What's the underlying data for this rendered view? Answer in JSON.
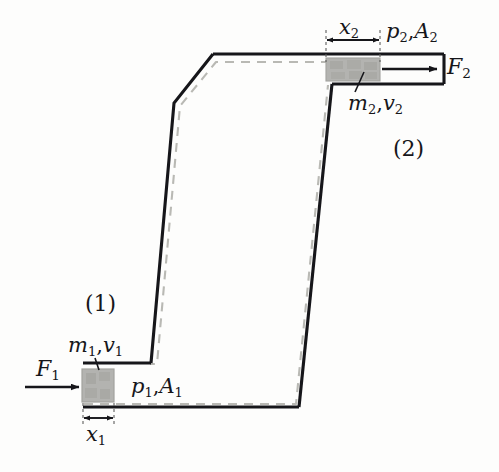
{
  "figure": {
    "kind": "physics-diagram",
    "topic": "Bernoulli / work-energy in a flow tube",
    "background_color": "#fdfdfc",
    "outline_color": "#16161a",
    "dashed_color": "#b9b9b4",
    "piston_fill": "#b3b3b0",
    "piston_edge": "#9a9a96"
  },
  "labels": {
    "force_left": {
      "base": "F",
      "sub": "1"
    },
    "force_right": {
      "base": "F",
      "sub": "2"
    },
    "mass_vel_left": {
      "m": "m",
      "m_sub": "1",
      "sep": ",",
      "v": "v",
      "v_sub": "1"
    },
    "mass_vel_right": {
      "m": "m",
      "m_sub": "2",
      "sep": ",",
      "v": "v",
      "v_sub": "2"
    },
    "pressure_area_left": {
      "p": "p",
      "p_sub": "1",
      "sep": ",",
      "a": "A",
      "a_sub": "1"
    },
    "pressure_area_right": {
      "p": "p",
      "p_sub": "2",
      "sep": ",",
      "a": "A",
      "a_sub": "2"
    },
    "displacement_left": {
      "base": "x",
      "sub": "1"
    },
    "displacement_right": {
      "base": "x",
      "sub": "2"
    },
    "station_one": "(1)",
    "station_two": "(2)"
  },
  "geometry": {
    "left_tube": {
      "top_y": 363,
      "bottom_y": 407,
      "left_x": 82,
      "junction_x": 150
    },
    "right_tube": {
      "top_y": 57,
      "bottom_y": 81,
      "right_x": 443,
      "junction_x": 331
    },
    "left_piston": {
      "x": 82,
      "y": 369,
      "w": 32,
      "h": 32
    },
    "right_piston": {
      "x": 326,
      "y": 58,
      "w": 54,
      "h": 22
    },
    "dimension_x1": {
      "x_start": 83,
      "x_end": 114,
      "y": 418
    },
    "dimension_x2": {
      "x_start": 326,
      "x_end": 380,
      "y": 40
    },
    "arrow_F1": {
      "x_start": 25,
      "x_end": 80,
      "y": 387
    },
    "arrow_F2": {
      "x_start": 382,
      "x_end": 438,
      "y": 69
    }
  }
}
